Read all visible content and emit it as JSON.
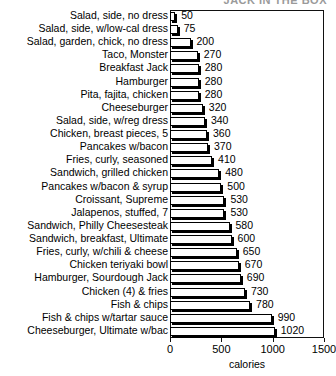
{
  "chart_data": {
    "type": "bar",
    "orientation": "horizontal",
    "title": "JACK IN THE BOX",
    "xlabel": "calories",
    "ylabel": "",
    "xlim": [
      0,
      1500
    ],
    "xticks": [
      0,
      500,
      1000,
      1500
    ],
    "grid": false,
    "legend": null,
    "show_value_labels": true,
    "categories": [
      "Salad, side, no dress",
      "Salad, side, w/low-cal dress",
      "Salad, garden, chick, no dress",
      "Taco, Monster",
      "Breakfast Jack",
      "Hamburger",
      "Pita, fajita, chicken",
      "Cheeseburger",
      "Salad, side, w/reg dress",
      "Chicken, breast pieces, 5",
      "Pancakes w/bacon",
      "Fries, curly, seasoned",
      "Sandwich, grilled chicken",
      "Pancakes w/bacon & syrup",
      "Croissant, Supreme",
      "Jalapenos, stuffed, 7",
      "Sandwich, Philly Cheesesteak",
      "Sandwich, breakfast, Ultimate",
      "Fries, curly, w/chili & cheese",
      "Chicken teriyaki bowl",
      "Hamburger, Sourdough Jack",
      "Chicken (4) & fries",
      "Fish & chips",
      "Fish & chips w/tartar sauce",
      "Cheeseburger, Ultimate w/bac"
    ],
    "values": [
      50,
      75,
      200,
      270,
      280,
      280,
      280,
      320,
      340,
      360,
      370,
      410,
      480,
      500,
      530,
      530,
      580,
      600,
      650,
      670,
      690,
      730,
      780,
      990,
      1020
    ],
    "value_labels": [
      "50",
      "75",
      "200",
      "270",
      "280",
      "280",
      "280",
      "320",
      "340",
      "360",
      "370",
      "410",
      "480",
      "500",
      "530",
      "530",
      "580",
      "600",
      "650",
      "670",
      "690",
      "730",
      "780",
      "990",
      "1020"
    ],
    "colors": {
      "bar_face": "#ffffff",
      "bar_edge": "#000000",
      "bar_shadow": "#000000",
      "text": "#000000",
      "frame": "#111111",
      "background": "#ffffff"
    }
  }
}
